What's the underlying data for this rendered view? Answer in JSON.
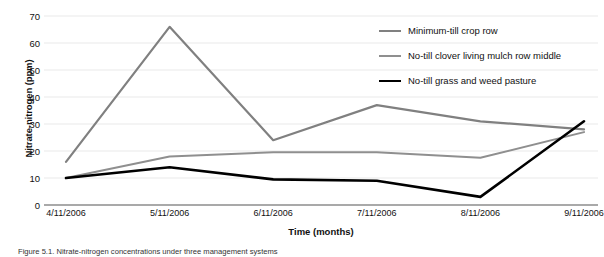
{
  "chart_data": {
    "type": "line",
    "title": "",
    "xlabel": "Time (months)",
    "ylabel": "Nitrate-nitrogen (ppm)",
    "categories": [
      "4/11/2006",
      "5/11/2006",
      "6/11/2006",
      "7/11/2006",
      "8/11/2006",
      "9/11/2006"
    ],
    "ylim": [
      0,
      70
    ],
    "yticks": [
      70,
      60,
      50,
      40,
      30,
      20,
      10,
      0
    ],
    "grid": true,
    "legend_position": "upper-right-inside",
    "series": [
      {
        "name": "Minimum-till crop row",
        "color": "#808080",
        "width": 2.2,
        "values": [
          16,
          66,
          24,
          37,
          31,
          28
        ]
      },
      {
        "name": "No-till clover living mulch row middle",
        "color": "#8f8f8f",
        "width": 2.0,
        "values": [
          10,
          18,
          19.5,
          19.5,
          17.5,
          27
        ]
      },
      {
        "name": "No-till grass and weed pasture",
        "color": "#000000",
        "width": 2.6,
        "values": [
          10,
          14,
          9.5,
          9,
          3,
          31
        ]
      }
    ]
  },
  "caption": {
    "text": "Figure 5.1. Nitrate-nitrogen concentrations under three management systems"
  },
  "axis": {
    "gridline_color": "#e9e9e9",
    "axis_line_color": "#8c8c8c"
  }
}
